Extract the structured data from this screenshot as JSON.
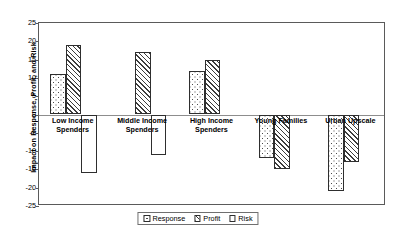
{
  "chart_data": {
    "type": "bar",
    "title": "",
    "xlabel": "",
    "ylabel": "Impact on Response, Profit, and Risk",
    "ylim": [
      -25,
      25
    ],
    "ytick_step": 5,
    "yticks": [
      "25",
      "20",
      "15",
      "10",
      "5",
      "0",
      "-5",
      "-10",
      "-15",
      "-20",
      "-25"
    ],
    "grid": false,
    "legend_position": "bottom-center",
    "categories": [
      "Low Income Spenders",
      "Middle Income Spenders",
      "High Income Spenders",
      "Young Families",
      "Urban Upscale"
    ],
    "category_lines": [
      [
        "Low Income",
        "Spenders"
      ],
      [
        "Middle Income",
        "Spenders"
      ],
      [
        "High Income",
        "Spenders"
      ],
      [
        "Young Families"
      ],
      [
        "Urban Upscale"
      ]
    ],
    "series": [
      {
        "name": "Response",
        "fill": "dotted",
        "values": [
          11,
          0,
          12,
          -12,
          -21
        ]
      },
      {
        "name": "Profit",
        "fill": "hatched",
        "values": [
          19,
          17,
          15,
          -15,
          -13
        ]
      },
      {
        "name": "Risk",
        "fill": "white",
        "values": [
          -16,
          -11,
          0,
          0,
          0
        ]
      }
    ]
  },
  "legend": {
    "items": [
      {
        "label": "Response",
        "swatch": "dotted"
      },
      {
        "label": "Profit",
        "swatch": "hatched"
      },
      {
        "label": "Risk",
        "swatch": "white"
      }
    ]
  },
  "colors": {
    "frame": "#5a5a5a",
    "zero_line": "#8d8d8d",
    "bar_outline": "#2e2e2e",
    "text": "#000000",
    "background": "#ffffff"
  }
}
